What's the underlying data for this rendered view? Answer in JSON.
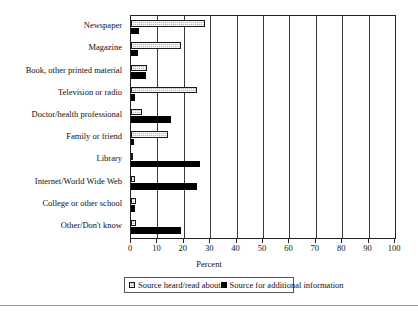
{
  "chart_data": {
    "type": "bar",
    "orientation": "horizontal",
    "title": "",
    "xlabel": "Percent",
    "ylabel": "",
    "xlim": [
      0,
      100
    ],
    "xticks": [
      0,
      10,
      20,
      30,
      40,
      50,
      60,
      70,
      80,
      90,
      100
    ],
    "grid": true,
    "grid_axis": "x",
    "legend_position": "bottom",
    "categories": [
      "Newspaper",
      "Magazine",
      "Book, other printed material",
      "Television or radio",
      "Doctor/health professional",
      "Family or friend",
      "Library",
      "Internet/World Wide Web",
      "College or other school",
      "Other/Don't know"
    ],
    "series": [
      {
        "name": "Source heard/read about",
        "pattern": "hatched",
        "color": "#b8b8b8",
        "values": [
          28,
          19,
          6,
          25,
          4,
          14,
          0.4,
          1.5,
          2,
          2
        ]
      },
      {
        "name": "Source for additional information",
        "pattern": "solid",
        "color": "#000000",
        "values": [
          3,
          2.5,
          5.5,
          1.5,
          15,
          1,
          26,
          25,
          1.5,
          19
        ]
      }
    ]
  },
  "axis": {
    "title": "Percent",
    "tick_labels": [
      "0",
      "10",
      "20",
      "30",
      "40",
      "50",
      "60",
      "70",
      "80",
      "90",
      "100"
    ]
  },
  "legend": {
    "entries": [
      {
        "label": "Source heard/read about",
        "swatch": "hatched-square-icon"
      },
      {
        "label": "Source for additional information",
        "swatch": "filled-square-icon"
      }
    ]
  }
}
